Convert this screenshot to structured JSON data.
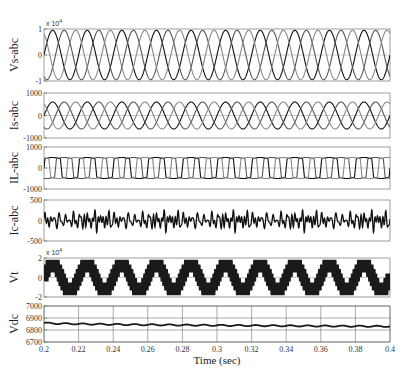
{
  "chart_data": {
    "type": "line",
    "layout": "6 stacked subplots sharing x-axis",
    "xlabel": "Time (sec)",
    "xlim": [
      0.2,
      0.4
    ],
    "xticks": [
      "0.2",
      "0.22",
      "0.24",
      "0.26",
      "0.28",
      "0.3",
      "0.32",
      "0.34",
      "0.36",
      "0.38",
      "0.4"
    ],
    "line_color": "#1a1a1a",
    "subplots": [
      {
        "id": "vs",
        "ylabel": "Vs-abc",
        "multiplier": "x 10^4",
        "ylim": [
          -1,
          1
        ],
        "yticks": [
          "-1",
          "0",
          "1"
        ],
        "grid": false,
        "signal": {
          "kind": "three-phase-sine",
          "amplitude": 0.95,
          "frequency_hz": 50,
          "cycles_shown": 10
        }
      },
      {
        "id": "is",
        "ylabel": "Is-abc",
        "multiplier": "",
        "ylim": [
          -1000,
          1000
        ],
        "yticks": [
          "-1000",
          "0",
          "1000"
        ],
        "grid": false,
        "signal": {
          "kind": "three-phase-sine",
          "amplitude": 600,
          "frequency_hz": 50,
          "cycles_shown": 10
        }
      },
      {
        "id": "il",
        "ylabel": "IL-abc",
        "multiplier": "",
        "ylim": [
          -1000,
          1000
        ],
        "yticks": [
          "-1000",
          "0",
          "1000"
        ],
        "grid": false,
        "signal": {
          "kind": "three-phase-quasi-square",
          "amplitude": 500,
          "frequency_hz": 50
        }
      },
      {
        "id": "ic",
        "ylabel": "Ic-abc",
        "multiplier": "",
        "ylim": [
          -500,
          500
        ],
        "yticks": [
          "-500",
          "0",
          "500"
        ],
        "grid": false,
        "signal": {
          "kind": "harmonic-compensation-current",
          "amplitude": 250,
          "frequency_hz": 50
        }
      },
      {
        "id": "vt",
        "ylabel": "Vt",
        "multiplier": "x 10^4",
        "ylim": [
          -2,
          2
        ],
        "yticks": [
          "-2",
          "0",
          "2"
        ],
        "grid": false,
        "signal": {
          "kind": "multilevel-staircase-pwm",
          "amplitude": 1.4,
          "frequency_hz": 50,
          "cycles_shown": 5
        }
      },
      {
        "id": "vdc",
        "ylabel": "Vdc",
        "multiplier": "",
        "ylim": [
          6700,
          7000
        ],
        "yticks": [
          "6700",
          "6800",
          "6900",
          "7000"
        ],
        "grid": true,
        "signal": {
          "kind": "dc-with-ripple",
          "start": 6860,
          "end": 6830,
          "ripple": 5,
          "ripple_frequency_hz": 100
        }
      }
    ]
  }
}
